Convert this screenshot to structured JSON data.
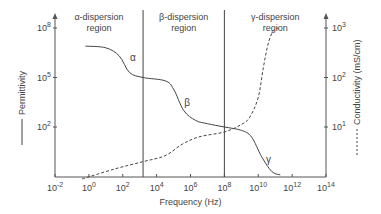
{
  "chart_data": {
    "type": "line",
    "title": "",
    "xlabel": "Frequency (Hz)",
    "ylabel_left": "Permittivity",
    "ylabel_right": "Conductivity (mS/cm)",
    "x_scale": "log",
    "xlim_exp": [
      -2,
      14
    ],
    "x_ticks": [
      {
        "exp": -2,
        "label": "10",
        "sup": "-2"
      },
      {
        "exp": 0,
        "label": "10",
        "sup": "0"
      },
      {
        "exp": 2,
        "label": "10",
        "sup": "2"
      },
      {
        "exp": 4,
        "label": "10",
        "sup": "4"
      },
      {
        "exp": 6,
        "label": "10",
        "sup": "6"
      },
      {
        "exp": 8,
        "label": "10",
        "sup": "8"
      },
      {
        "exp": 10,
        "label": "10",
        "sup": "10"
      },
      {
        "exp": 12,
        "label": "10",
        "sup": "12"
      },
      {
        "exp": 14,
        "label": "10",
        "sup": "14"
      }
    ],
    "y_left_ticks": [
      {
        "exp": 8,
        "label": "10",
        "sup": "8"
      },
      {
        "exp": 5,
        "label": "10",
        "sup": "5"
      },
      {
        "exp": 2,
        "label": "10",
        "sup": "2"
      }
    ],
    "y_right_ticks": [
      {
        "exp": 3,
        "label": "10",
        "sup": "3"
      },
      {
        "exp": 2,
        "label": "10",
        "sup": "2"
      },
      {
        "exp": 1,
        "label": "10",
        "sup": "1"
      }
    ],
    "regions": [
      {
        "name": "α-dispersion region",
        "line1": "α-dispersion",
        "line2": "region",
        "boundary_exp": 3.2
      },
      {
        "name": "β-dispersion region",
        "line1": "β-dispersion",
        "line2": "region",
        "boundary_exp": 8
      },
      {
        "name": "γ-dispersion region",
        "line1": "γ-dispersion",
        "line2": "region"
      }
    ],
    "series": [
      {
        "name": "Permittivity",
        "axis": "left",
        "style": "solid",
        "x_exp": [
          -0.2,
          1.0,
          1.8,
          2.4,
          3.2,
          4.5,
          5.0,
          5.6,
          6.3,
          7.0,
          8.0,
          9.0,
          9.6,
          10.2,
          10.8,
          11.3
        ],
        "y_exp": [
          6.9,
          6.8,
          6.3,
          5.3,
          5.0,
          4.8,
          4.3,
          3.0,
          2.4,
          2.2,
          2.0,
          1.8,
          1.4,
          0.2,
          -0.7,
          -0.9
        ],
        "labels": [
          {
            "text": "α",
            "x_exp": 2.6,
            "y_exp": 6.0
          },
          {
            "text": "β",
            "x_exp": 5.8,
            "y_exp": 3.3
          },
          {
            "text": "γ",
            "x_exp": 10.6,
            "y_exp": -0.2
          }
        ]
      },
      {
        "name": "Conductivity",
        "axis": "right",
        "style": "dashed",
        "x_exp": [
          -0.4,
          1.5,
          3.2,
          4.5,
          5.5,
          6.5,
          8.0,
          9.0,
          9.5,
          10.0,
          10.3,
          10.6,
          10.9,
          11.2
        ],
        "y_exp_right": [
          -0.05,
          0.15,
          0.3,
          0.42,
          0.65,
          0.8,
          0.9,
          1.05,
          1.2,
          1.6,
          2.2,
          2.7,
          2.95,
          3.0
        ]
      }
    ],
    "legend": {
      "position": "axis-labels",
      "permittivity_style": "solid",
      "conductivity_style": "dashed"
    },
    "grid": false
  }
}
